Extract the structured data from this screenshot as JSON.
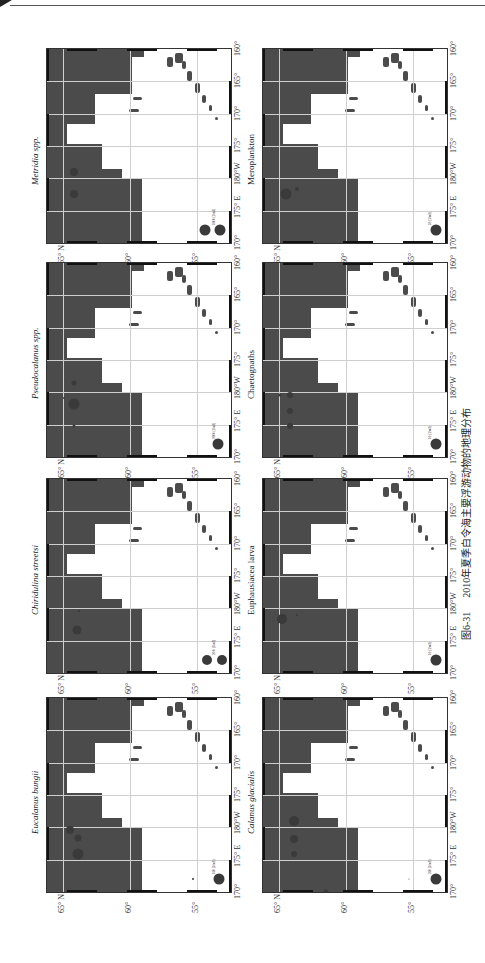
{
  "caption": {
    "figure_number": "图6-31",
    "text": "2010年夏季白令海主要浮游动物的地理分布"
  },
  "axes": {
    "lon_labels": [
      "170°",
      "175° E",
      "180°W",
      "175°",
      "170°",
      "165°",
      "160°"
    ],
    "lat_labels": [
      "65° N",
      "60°",
      "55°"
    ]
  },
  "panels": [
    {
      "id": "metridia",
      "title": "Metridia spp.",
      "italic": true,
      "legend": "5000 (1/m3)",
      "column": 0,
      "row": 0,
      "dots": [
        {
          "lon": 167.5,
          "lat": 64.2,
          "size": 8
        },
        {
          "lon": 168.8,
          "lat": 64.2,
          "size": 8
        },
        {
          "lon": 174.5,
          "lat": 62.4,
          "size": 4
        },
        {
          "lon": 178.5,
          "lat": 61.0,
          "size": 2
        },
        {
          "lon": 171.0,
          "lat": 54.4,
          "size": 11
        },
        {
          "lon": 171.0,
          "lat": 53.3,
          "size": 11
        }
      ]
    },
    {
      "id": "pseudocalanus",
      "title": "Pseudocalanus spp.",
      "italic": true,
      "legend": "2000 (1/m3)",
      "column": 0,
      "row": 1,
      "dots": [
        {
          "lon": 167.3,
          "lat": 64.2,
          "size": 5
        },
        {
          "lon": 168.6,
          "lat": 64.2,
          "size": 11
        },
        {
          "lon": 169.9,
          "lat": 64.2,
          "size": 3
        },
        {
          "lon": 168.2,
          "lat": 64.9,
          "size": 2
        },
        {
          "lon": 171.0,
          "lat": 53.5,
          "size": 11
        }
      ]
    },
    {
      "id": "chiridius",
      "title": "Chiridulina streetsi",
      "italic": true,
      "legend": "20.0 (1/m3)",
      "column": 0,
      "row": 2,
      "dots": [
        {
          "lon": 169.2,
          "lat": 64.0,
          "size": 9
        },
        {
          "lon": 168.0,
          "lat": 63.8,
          "size": 2
        },
        {
          "lon": 174.0,
          "lat": 62.4,
          "size": 3
        },
        {
          "lon": 179.0,
          "lat": 60.0,
          "size": 3
        },
        {
          "lon": 175.0,
          "lat": 58.2,
          "size": 7
        },
        {
          "lon": 171.0,
          "lat": 54.3,
          "size": 10
        },
        {
          "lon": 171.0,
          "lat": 53.2,
          "size": 10
        }
      ]
    },
    {
      "id": "eucalanus",
      "title": "Eucalanus bungii",
      "italic": true,
      "legend": "100 (1/m3)",
      "column": 0,
      "row": 3,
      "dots": [
        {
          "lon": 168.0,
          "lat": 64.5,
          "size": 8
        },
        {
          "lon": 168.5,
          "lat": 63.9,
          "size": 7
        },
        {
          "lon": 169.5,
          "lat": 63.9,
          "size": 11
        },
        {
          "lon": 180.0,
          "lat": 60.0,
          "size": 11
        },
        {
          "lon": 175.5,
          "lat": 58.0,
          "size": 5
        },
        {
          "lon": 171.0,
          "lat": 55.3,
          "size": 2
        },
        {
          "lon": 171.0,
          "lat": 53.4,
          "size": 11
        }
      ]
    },
    {
      "id": "meroplankton",
      "title": "Meroplankton",
      "italic": false,
      "legend": "50 (1/m3)",
      "column": 1,
      "row": 0,
      "dots": [
        {
          "lon": 168.8,
          "lat": 64.5,
          "size": 11
        },
        {
          "lon": 168.5,
          "lat": 63.7,
          "size": 4
        },
        {
          "lon": 172.5,
          "lat": 62.2,
          "size": 2
        },
        {
          "lon": 179.5,
          "lat": 60.0,
          "size": 3
        },
        {
          "lon": 175.5,
          "lat": 58.0,
          "size": 3
        },
        {
          "lon": 171.0,
          "lat": 53.3,
          "size": 11
        }
      ]
    },
    {
      "id": "chaetognaths",
      "title": "Chaetognaths",
      "italic": false,
      "legend": "10 (1/m3)",
      "column": 1,
      "row": 1,
      "dots": [
        {
          "lon": 168.0,
          "lat": 64.2,
          "size": 6
        },
        {
          "lon": 169.0,
          "lat": 64.2,
          "size": 6
        },
        {
          "lon": 169.9,
          "lat": 64.2,
          "size": 6
        },
        {
          "lon": 168.0,
          "lat": 64.9,
          "size": 3
        },
        {
          "lon": 172.0,
          "lat": 61.8,
          "size": 6
        },
        {
          "lon": 173.0,
          "lat": 61.6,
          "size": 11
        },
        {
          "lon": 178.0,
          "lat": 60.0,
          "size": 5
        },
        {
          "lon": 175.5,
          "lat": 58.0,
          "size": 8
        },
        {
          "lon": 171.0,
          "lat": 53.3,
          "size": 11
        }
      ]
    },
    {
      "id": "euphausiacea",
      "title": "Euphausiacea larva",
      "italic": false,
      "legend": "10 (1/m3)",
      "column": 1,
      "row": 2,
      "dots": [
        {
          "lon": 168.5,
          "lat": 64.8,
          "size": 10
        },
        {
          "lon": 168.3,
          "lat": 63.7,
          "size": 2
        },
        {
          "lon": 178.5,
          "lat": 60.0,
          "size": 2
        },
        {
          "lon": 175.5,
          "lat": 58.0,
          "size": 2
        },
        {
          "lon": 171.0,
          "lat": 53.3,
          "size": 11
        }
      ]
    },
    {
      "id": "calanus",
      "title": "Calanus glacialis",
      "italic": true,
      "legend": "200 (1/m3)",
      "column": 1,
      "row": 3,
      "dots": [
        {
          "lon": 167.5,
          "lat": 63.9,
          "size": 10
        },
        {
          "lon": 168.6,
          "lat": 63.9,
          "size": 8
        },
        {
          "lon": 169.5,
          "lat": 63.9,
          "size": 6
        },
        {
          "lon": 171.8,
          "lat": 61.5,
          "size": 5
        },
        {
          "lon": 173.3,
          "lat": 61.4,
          "size": 5
        },
        {
          "lon": 178.5,
          "lat": 60.0,
          "size": 3
        },
        {
          "lon": 171.0,
          "lat": 55.3,
          "size": 1
        },
        {
          "lon": 171.0,
          "lat": 53.3,
          "size": 11
        }
      ]
    }
  ]
}
